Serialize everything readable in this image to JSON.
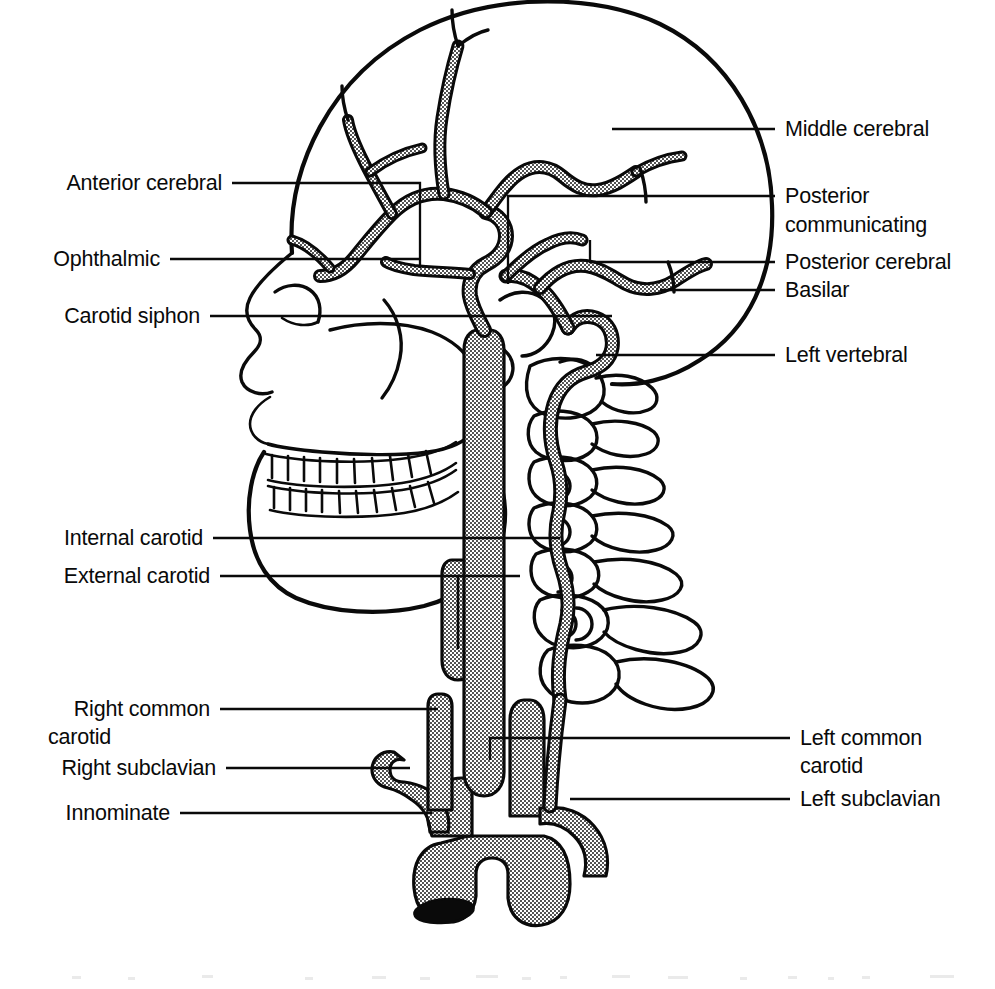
{
  "figure": {
    "title": "Arterial supply to the brain: lateral view",
    "background_color": "#ffffff",
    "ink_color": "#0a0a0a"
  },
  "labels": {
    "left": [
      {
        "id": "anterior-cerebral",
        "text": "Anterior cerebral",
        "lines": [
          "Anterior cerebral"
        ],
        "text_x": 222,
        "text_y": 190,
        "leader": "M 232 183 L 420 183 L 420 268"
      },
      {
        "id": "ophthalmic",
        "text": "Ophthalmic",
        "lines": [
          "Ophthalmic"
        ],
        "text_x": 160,
        "text_y": 266,
        "leader": "M 170 259 L 420 259"
      },
      {
        "id": "carotid-siphon",
        "text": "Carotid siphon",
        "lines": [
          "Carotid siphon"
        ],
        "text_x": 200,
        "text_y": 323,
        "leader": "M 210 316 L 612 316"
      },
      {
        "id": "internal-carotid",
        "text": "Internal carotid",
        "lines": [
          "Internal carotid"
        ],
        "text_x": 203,
        "text_y": 545,
        "leader": "M 213 538 L 560 538"
      },
      {
        "id": "external-carotid",
        "text": "External carotid",
        "lines": [
          "External carotid"
        ],
        "text_x": 210,
        "text_y": 583,
        "leader": "M 220 576 L 520 576"
      },
      {
        "id": "right-common-carotid",
        "text": "Right common carotid",
        "lines": [
          "Right common",
          "carotid"
        ],
        "text_x": 210,
        "text_y": 716,
        "leader": "M 220 709 L 438 709"
      },
      {
        "id": "right-subclavian",
        "text": "Right subclavian",
        "lines": [
          "Right subclavian"
        ],
        "text_x": 216,
        "text_y": 775,
        "leader": "M 226 768 L 410 768"
      },
      {
        "id": "innominate",
        "text": "Innominate",
        "lines": [
          "Innominate"
        ],
        "text_x": 170,
        "text_y": 820,
        "leader": "M 180 813 L 432 813"
      }
    ],
    "right": [
      {
        "id": "middle-cerebral",
        "text": "Middle cerebral",
        "lines": [
          "Middle cerebral"
        ],
        "text_x": 785,
        "text_y": 136,
        "leader": "M 612 129 L 775 129"
      },
      {
        "id": "posterior-communicating",
        "text": "Posterior communicating",
        "lines": [
          "Posterior",
          "communicating"
        ],
        "text_x": 785,
        "text_y": 203,
        "leader": "M 508 196 L 508 284 M 508 196 L 775 196"
      },
      {
        "id": "posterior-cerebral",
        "text": "Posterior cerebral",
        "lines": [
          "Posterior cerebral"
        ],
        "text_x": 785,
        "text_y": 269,
        "leader": "M 590 262 L 775 262 M 590 262 L 590 240"
      },
      {
        "id": "basilar",
        "text": "Basilar",
        "lines": [
          "Basilar"
        ],
        "text_x": 785,
        "text_y": 297,
        "leader": "M 660 290 L 775 290"
      },
      {
        "id": "left-vertebral",
        "text": "Left vertebral",
        "lines": [
          "Left vertebral"
        ],
        "text_x": 785,
        "text_y": 362,
        "leader": "M 596 355 L 775 355"
      },
      {
        "id": "left-common-carotid",
        "text": "Left common carotid",
        "lines": [
          "Left common",
          "carotid"
        ],
        "text_x": 800,
        "text_y": 745,
        "leader": "M 490 738 L 790 738 M 490 738 L 490 760"
      },
      {
        "id": "left-subclavian",
        "text": "Left subclavian",
        "lines": [
          "Left subclavian"
        ],
        "text_x": 800,
        "text_y": 806,
        "leader": "M 570 799 L 790 799"
      }
    ]
  },
  "anatomy": {
    "structures": [
      "skull-cranial-vault",
      "facial-skeleton",
      "maxilla-teeth",
      "mandible-teeth",
      "cervical-vertebrae-c1-c7",
      "aortic-arch",
      "innominate-artery",
      "right-subclavian-artery",
      "right-common-carotid-artery",
      "left-common-carotid-artery",
      "left-subclavian-artery",
      "internal-carotid-artery",
      "external-carotid-artery",
      "vertebral-artery",
      "basilar-artery",
      "carotid-siphon",
      "ophthalmic-artery",
      "anterior-cerebral-artery",
      "middle-cerebral-artery",
      "posterior-cerebral-artery",
      "posterior-communicating-artery"
    ],
    "artery_count": 15,
    "vertebra_count": 7
  }
}
